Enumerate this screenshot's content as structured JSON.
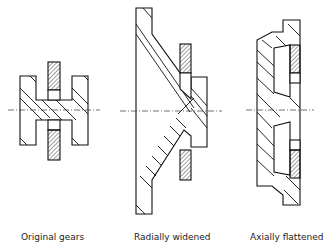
{
  "figure": {
    "panels": [
      {
        "id": "original",
        "label": "Original gears"
      },
      {
        "id": "radial",
        "label": "Radially widened"
      },
      {
        "id": "axial",
        "label": "Axially flattened"
      }
    ]
  },
  "colors": {
    "line": "#111111",
    "background": "#ffffff"
  }
}
